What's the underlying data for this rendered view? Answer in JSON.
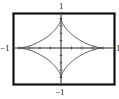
{
  "chart_data": {
    "type": "line",
    "title": "",
    "xlabel": "",
    "ylabel": "",
    "xlim": [
      -1.15,
      1.15
    ],
    "ylim": [
      -1.15,
      1.15
    ],
    "grid": false,
    "legend": null,
    "axis_labels": {
      "top": "1",
      "bottom": "−1",
      "left": "−1",
      "right": "1"
    },
    "ticks_per_half_axis": 4,
    "series": [
      {
        "name": "astroid",
        "x": [
          1,
          0.7,
          0.35,
          0.13,
          0.03,
          0,
          -0.03,
          -0.13,
          -0.35,
          -0.7,
          -1,
          -0.7,
          -0.35,
          -0.13,
          -0.03,
          0,
          0.03,
          0.13,
          0.35,
          0.7,
          1
        ],
        "y": [
          0,
          0.03,
          0.13,
          0.35,
          0.7,
          1,
          0.7,
          0.35,
          0.13,
          0.03,
          0,
          -0.03,
          -0.13,
          -0.35,
          -0.7,
          -1,
          -0.7,
          -0.35,
          -0.13,
          -0.03,
          0
        ]
      }
    ]
  },
  "labels": {
    "top": "1",
    "bottom": "−1",
    "left": "−1",
    "right": "1"
  },
  "colors": {
    "frame": "#111111",
    "axes": "#222222",
    "curve": "#444444"
  }
}
